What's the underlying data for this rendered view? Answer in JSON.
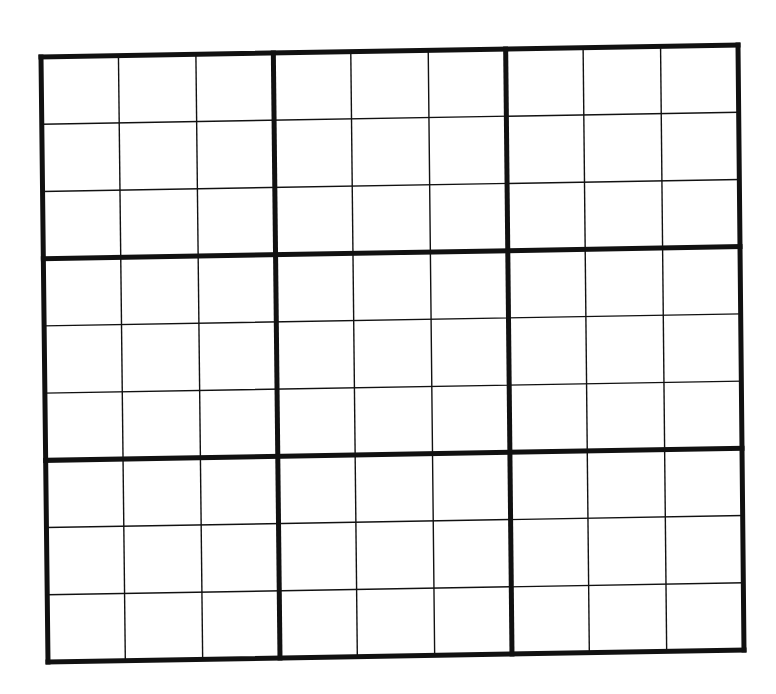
{
  "puzzle": {
    "type": "sudoku",
    "rows": 9,
    "cols": 9,
    "box_size": 3,
    "cells": [
      [
        "",
        "",
        "",
        "",
        "",
        "",
        "",
        "",
        ""
      ],
      [
        "",
        "",
        "",
        "",
        "",
        "",
        "",
        "",
        ""
      ],
      [
        "",
        "",
        "",
        "",
        "",
        "",
        "",
        "",
        ""
      ],
      [
        "",
        "",
        "",
        "",
        "",
        "",
        "",
        "",
        ""
      ],
      [
        "",
        "",
        "",
        "",
        "",
        "",
        "",
        "",
        ""
      ],
      [
        "",
        "",
        "",
        "",
        "",
        "",
        "",
        "",
        ""
      ],
      [
        "",
        "",
        "",
        "",
        "",
        "",
        "",
        "",
        ""
      ],
      [
        "",
        "",
        "",
        "",
        "",
        "",
        "",
        "",
        ""
      ],
      [
        "",
        "",
        "",
        "",
        "",
        "",
        "",
        "",
        ""
      ]
    ]
  },
  "colors": {
    "background": "#ffffff",
    "line": "#111111"
  }
}
